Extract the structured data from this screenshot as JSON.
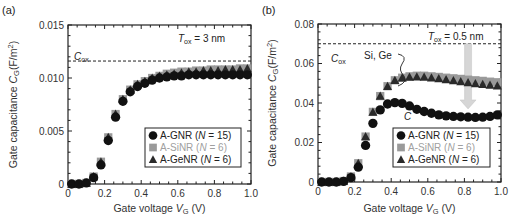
{
  "chart_data": [
    {
      "type": "scatter",
      "panel_label": "(a)",
      "title": "",
      "xlabel": "Gate voltage V_G (V)",
      "xlabel_parts": {
        "pre": "Gate voltage ",
        "var": "V",
        "sub": "G",
        "post": " (V)"
      },
      "ylabel": "Gate capacitance C_G(F/m^2)",
      "ylabel_parts": {
        "pre": "Gate capacitance ",
        "var": "C",
        "sub": "G",
        "post": "(F/m",
        "sup": "2",
        "end": ")"
      },
      "xlim": [
        0,
        1.0
      ],
      "ylim": [
        0,
        0.015
      ],
      "xticks": [
        0,
        0.2,
        0.4,
        0.6,
        0.8,
        1.0
      ],
      "xtick_labels": [
        "0",
        "0.2",
        "0.4",
        "0.6",
        "0.8",
        "1.0"
      ],
      "yticks": [
        0,
        0.005,
        0.01,
        0.015
      ],
      "ytick_labels": [
        "0",
        "0.005",
        "0.010",
        "0.015"
      ],
      "grid": false,
      "legend_position": "lower right",
      "reference_line": {
        "label": "C_ox",
        "label_var": "C",
        "label_sub": "ox",
        "value": 0.0116,
        "style": "dashed"
      },
      "annotations": [
        {
          "text": "T_ox = 3 nm",
          "var": "T",
          "sub": "ox",
          "rest": " = 3 nm"
        }
      ],
      "x": [
        0.02,
        0.06,
        0.1,
        0.14,
        0.18,
        0.22,
        0.26,
        0.3,
        0.34,
        0.38,
        0.42,
        0.46,
        0.5,
        0.54,
        0.58,
        0.62,
        0.66,
        0.7,
        0.74,
        0.78,
        0.82,
        0.86,
        0.9,
        0.94,
        0.98
      ],
      "series": [
        {
          "name": "A-SiNR (N = 6)",
          "label_main": "A-SiNR (",
          "label_var": "N",
          "label_rest": " = 6)",
          "marker": "square",
          "color": "#9a9a9a",
          "values": [
            0,
            0,
            0.0001,
            0.0007,
            0.0021,
            0.0044,
            0.0066,
            0.008,
            0.0089,
            0.0094,
            0.0097,
            0.01,
            0.0102,
            0.0104,
            0.0105,
            0.0106,
            0.0106,
            0.0107,
            0.0107,
            0.0108,
            0.0108,
            0.0108,
            0.0108,
            0.0109,
            0.0109
          ]
        },
        {
          "name": "A-GeNR (N = 6)",
          "label_main": "A-GeNR (",
          "label_var": "N",
          "label_rest": " = 6)",
          "marker": "triangle",
          "color": "#2a2a2a",
          "values": [
            0,
            0,
            0.0001,
            0.0007,
            0.0021,
            0.0044,
            0.0066,
            0.008,
            0.0089,
            0.0094,
            0.0097,
            0.01,
            0.0102,
            0.0103,
            0.0104,
            0.0105,
            0.0106,
            0.0106,
            0.0107,
            0.0107,
            0.0107,
            0.0108,
            0.0108,
            0.0108,
            0.0109
          ]
        },
        {
          "name": "A-GNR (N = 15)",
          "label_main": "A-GNR (",
          "label_var": "N",
          "label_rest": " = 15)",
          "marker": "circle",
          "color": "#111111",
          "values": [
            0,
            0,
            0.0001,
            0.0006,
            0.0018,
            0.0041,
            0.0063,
            0.0078,
            0.0087,
            0.0092,
            0.0095,
            0.0098,
            0.01,
            0.0101,
            0.0102,
            0.0102,
            0.0103,
            0.0103,
            0.0103,
            0.0103,
            0.0103,
            0.0103,
            0.0103,
            0.0103,
            0.0103
          ]
        }
      ],
      "legend_order": [
        2,
        0,
        1
      ]
    },
    {
      "type": "scatter",
      "panel_label": "(b)",
      "title": "",
      "xlabel": "Gate voltage V_G (V)",
      "xlabel_parts": {
        "pre": "Gate voltage ",
        "var": "V",
        "sub": "G",
        "post": " (V)"
      },
      "ylabel": "Gate capacitance C_G(F/m^2)",
      "ylabel_parts": {
        "pre": "Gate capacitance ",
        "var": "C",
        "sub": "G",
        "post": "(F/m",
        "sup": "2",
        "end": ")"
      },
      "xlim": [
        0,
        1.0
      ],
      "ylim": [
        0,
        0.08
      ],
      "xticks": [
        0,
        0.2,
        0.4,
        0.6,
        0.8,
        1.0
      ],
      "xtick_labels": [
        "0",
        "0.2",
        "0.4",
        "0.6",
        "0.8",
        "1.0"
      ],
      "yticks": [
        0,
        0.02,
        0.04,
        0.06,
        0.08
      ],
      "ytick_labels": [
        "0",
        "0.02",
        "0.04",
        "0.06",
        "0.08"
      ],
      "grid": false,
      "legend_position": "lower right",
      "reference_line": {
        "label": "C_ox",
        "label_var": "C",
        "label_sub": "ox",
        "value": 0.07,
        "style": "dashed"
      },
      "annotations": [
        {
          "text": "T_ox = 0.5 nm",
          "var": "T",
          "sub": "ox",
          "rest": " = 0.5 nm"
        },
        {
          "text": "Si, Ge"
        },
        {
          "text": "C"
        }
      ],
      "arrow": {
        "from_value": 0.07,
        "to_value": 0.037,
        "x": 0.82,
        "color": "#d6d6d6"
      },
      "x": [
        0.02,
        0.06,
        0.1,
        0.14,
        0.18,
        0.22,
        0.26,
        0.3,
        0.34,
        0.38,
        0.42,
        0.46,
        0.5,
        0.54,
        0.58,
        0.62,
        0.66,
        0.7,
        0.74,
        0.78,
        0.82,
        0.86,
        0.9,
        0.94,
        0.98
      ],
      "series": [
        {
          "name": "A-SiNR (N = 6)",
          "label_main": "A-SiNR (",
          "label_var": "N",
          "label_rest": " = 6)",
          "marker": "square",
          "color": "#9a9a9a",
          "values": [
            0,
            0,
            0,
            0.0005,
            0.0028,
            0.0095,
            0.023,
            0.0355,
            0.0435,
            0.0485,
            0.0515,
            0.0528,
            0.0535,
            0.0538,
            0.0538,
            0.0535,
            0.0532,
            0.0528,
            0.0525,
            0.0522,
            0.0518,
            0.0515,
            0.0512,
            0.0508,
            0.0505
          ]
        },
        {
          "name": "A-GeNR (N = 6)",
          "label_main": "A-GeNR (",
          "label_var": "N",
          "label_rest": " = 6)",
          "marker": "triangle",
          "color": "#2a2a2a",
          "values": [
            0,
            0,
            0,
            0.0005,
            0.0028,
            0.0095,
            0.023,
            0.0355,
            0.0435,
            0.0485,
            0.0515,
            0.0528,
            0.0532,
            0.0533,
            0.0532,
            0.0528,
            0.0524,
            0.0519,
            0.0514,
            0.0509,
            0.0504,
            0.0499,
            0.0495,
            0.0491,
            0.0487
          ]
        },
        {
          "name": "A-GNR (N = 15)",
          "label_main": "A-GNR (",
          "label_var": "N",
          "label_rest": " = 15)",
          "marker": "circle",
          "color": "#111111",
          "values": [
            0,
            0,
            0,
            0.0003,
            0.0022,
            0.0075,
            0.0185,
            0.0297,
            0.0365,
            0.0395,
            0.0402,
            0.0398,
            0.0385,
            0.0368,
            0.0357,
            0.0348,
            0.034,
            0.0335,
            0.0332,
            0.033,
            0.0328,
            0.0327,
            0.0328,
            0.0332,
            0.034
          ]
        }
      ],
      "legend_order": [
        2,
        0,
        1
      ]
    }
  ]
}
